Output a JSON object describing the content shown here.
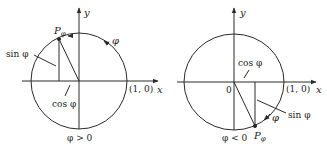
{
  "figure": {
    "stroke_color": "#2a2a2a",
    "background": "#ffffff",
    "left": {
      "x_axis_label": "x",
      "y_axis_label": "y",
      "point_label": "P",
      "point_subscript": "φ",
      "angle_label": "φ",
      "sin_label": "sin φ",
      "cos_label": "cos φ",
      "unit_point_label": "(1, 0)",
      "condition_label": "φ > 0"
    },
    "right": {
      "x_axis_label": "x",
      "y_axis_label": "y",
      "origin_label": "0",
      "point_label": "P",
      "point_subscript": "φ",
      "angle_label": "φ",
      "sin_label": "sin φ",
      "cos_label": "cos φ",
      "unit_point_label": "(1, 0)",
      "condition_label": "φ < 0"
    }
  }
}
